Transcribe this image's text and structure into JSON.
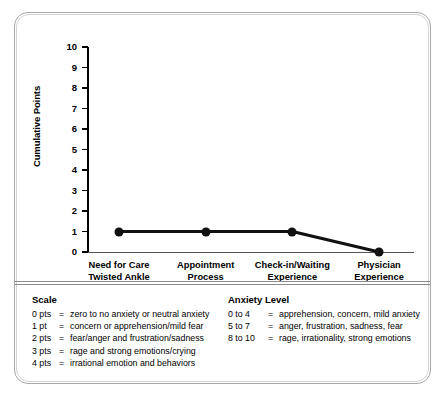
{
  "chart_data": {
    "type": "line",
    "title": "",
    "xlabel": "",
    "ylabel": "Cumulative Points",
    "categories": [
      "Need for Care\nTwisted Ankle",
      "Appointment\nProcess",
      "Check-in/Waiting\nExperience",
      "Physician\nExperience"
    ],
    "category_lines": [
      [
        "Need for Care",
        "Twisted Ankle"
      ],
      [
        "Appointment",
        "Process"
      ],
      [
        "Check-in/Waiting",
        "Experience"
      ],
      [
        "Physician",
        "Experience"
      ]
    ],
    "values": [
      1,
      1,
      1,
      0
    ],
    "ylim": [
      0,
      10
    ],
    "y_ticks": [
      10,
      9,
      8,
      7,
      6,
      5,
      4,
      3,
      2,
      1,
      0
    ],
    "grid": false,
    "legend_position": "none",
    "marker": "filled-circle",
    "line_color": "#111111",
    "marker_color": "#111111"
  },
  "legend": {
    "scale": {
      "title": "Scale",
      "rows": [
        {
          "key": "0 pts",
          "eq": "=",
          "desc": "zero to no anxiety or neutral anxiety"
        },
        {
          "key": "1 pt",
          "eq": "=",
          "desc": "concern or apprehension/mild fear"
        },
        {
          "key": "2 pts",
          "eq": "=",
          "desc": "fear/anger and frustration/sadness"
        },
        {
          "key": "3 pts",
          "eq": "=",
          "desc": "rage and strong emotions/crying"
        },
        {
          "key": "4 pts",
          "eq": "=",
          "desc": "irrational emotion and behaviors"
        }
      ]
    },
    "anxiety": {
      "title": "Anxiety Level",
      "rows": [
        {
          "key": "0 to 4",
          "eq": "=",
          "desc": "apprehension, concern, mild anxiety"
        },
        {
          "key": "5 to 7",
          "eq": "=",
          "desc": "anger, frustration, sadness, fear"
        },
        {
          "key": "8 to 10",
          "eq": "=",
          "desc": "rage, irrationality, strong emotions"
        }
      ]
    }
  }
}
